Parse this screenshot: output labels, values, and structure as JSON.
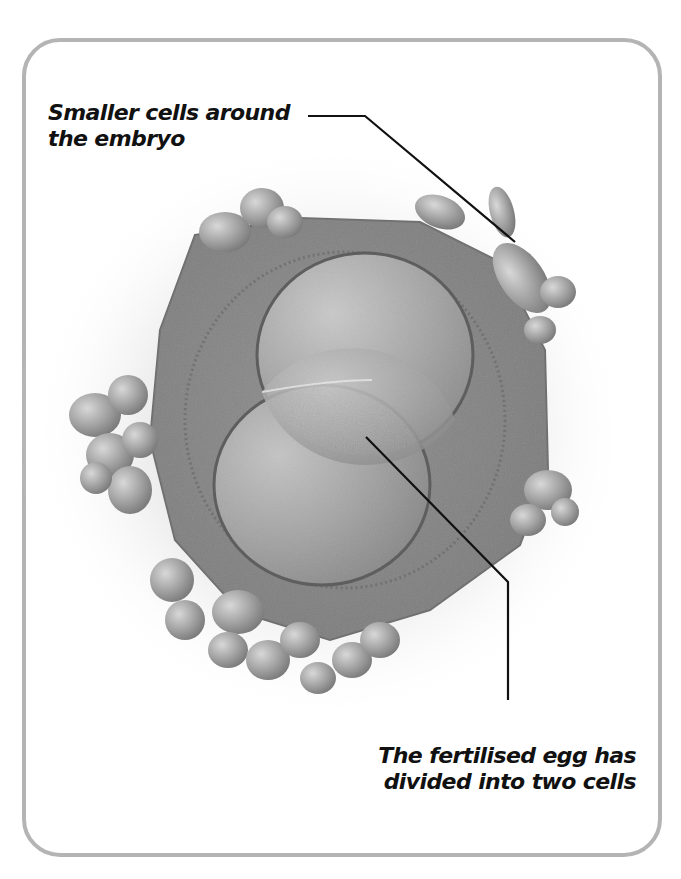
{
  "figure": {
    "labels": {
      "top": {
        "line1": "Smaller cells around",
        "line2": "the embryo"
      },
      "bottom": {
        "line1": "The fertilised egg has",
        "line2": "divided into two cells"
      }
    },
    "colors": {
      "frame_border": "#b4b4b4",
      "background": "#ffffff",
      "leader_line": "#111111",
      "text": "#111111"
    }
  }
}
